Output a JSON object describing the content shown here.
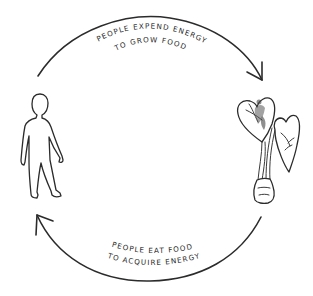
{
  "diagram": {
    "type": "cycle",
    "nodes": [
      {
        "id": "person",
        "icon": "person-icon",
        "position": "left"
      },
      {
        "id": "plant",
        "icon": "plant-icon",
        "position": "right"
      }
    ],
    "edges": [
      {
        "from": "person",
        "to": "plant",
        "direction": "clockwise-top",
        "label_line1": "PEOPLE EXPEND ENERGY",
        "label_line2": "TO GROW FOOD"
      },
      {
        "from": "plant",
        "to": "person",
        "direction": "clockwise-bottom",
        "label_line1": "PEOPLE EAT FOOD",
        "label_line2": "TO ACQUIRE ENERGY"
      }
    ],
    "colors": {
      "background": "#ffffff",
      "ink": "#2b2b2b"
    }
  }
}
